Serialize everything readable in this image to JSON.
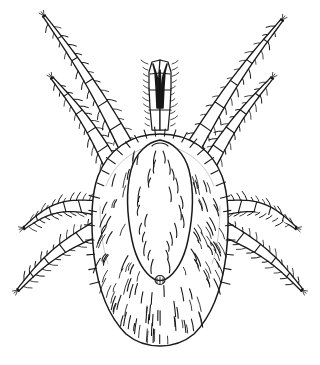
{
  "figure": {
    "kind": "scientific-line-illustration",
    "view": "dorsal",
    "background_color": "#ffffff",
    "ink_color": "#1a1a1a",
    "ghost_color": "#c9c9c9",
    "width": 320,
    "height": 365,
    "caption": "",
    "title": "",
    "label_text": "",
    "has_text": "false"
  },
  "anatomy": {
    "idiosoma": {
      "name": "idiosoma",
      "shape": "oval",
      "center_x": 160,
      "center_y": 240,
      "radius_x": 68,
      "radius_y": 106,
      "top_y": 134,
      "bottom_y": 346,
      "left_x": 92,
      "right_x": 228
    },
    "dorsal_shield": {
      "name": "dorsal-shield",
      "top_y": 140,
      "tip_y": 278,
      "max_half_width": 32,
      "widest_y": 190
    },
    "posterior_organ": {
      "name": "posterior-organ",
      "cx": 160,
      "cy": 280,
      "r": 5
    },
    "gnathosoma": {
      "name": "gnathosoma",
      "base_y": 132,
      "apex_y": 62
    },
    "chelicerae": {
      "count": 2,
      "tip_y": 64,
      "base_y": 108,
      "color": "#111111"
    },
    "palps": {
      "count": 2,
      "segments": 4
    },
    "setae": {
      "body_count": 120,
      "marginal_count": 46,
      "shield_count": 26
    }
  },
  "legs": [
    {
      "id": "leg-1-left",
      "side": "left",
      "pair": 1,
      "direction": "anterior-outward",
      "origin_x": 128,
      "origin_y": 150,
      "tip_x": 44,
      "tip_y": 16,
      "segments": 6,
      "bristles": 26
    },
    {
      "id": "leg-2-left",
      "side": "left",
      "pair": 2,
      "direction": "anterior-outward",
      "origin_x": 113,
      "origin_y": 168,
      "tip_x": 52,
      "tip_y": 78,
      "segments": 5,
      "bristles": 22
    },
    {
      "id": "leg-3-left",
      "side": "left",
      "pair": 3,
      "direction": "lateral",
      "origin_x": 96,
      "origin_y": 208,
      "tip_x": 24,
      "tip_y": 228,
      "segments": 5,
      "bristles": 22
    },
    {
      "id": "leg-4-left",
      "side": "left",
      "pair": 4,
      "direction": "posterior-outward",
      "origin_x": 98,
      "origin_y": 228,
      "tip_x": 18,
      "tip_y": 290,
      "segments": 5,
      "bristles": 22
    },
    {
      "id": "leg-1-right",
      "side": "right",
      "pair": 1,
      "direction": "anterior-outward",
      "origin_x": 192,
      "origin_y": 150,
      "tip_x": 282,
      "tip_y": 20,
      "segments": 6,
      "bristles": 26
    },
    {
      "id": "leg-2-right",
      "side": "right",
      "pair": 2,
      "direction": "anterior-outward",
      "origin_x": 207,
      "origin_y": 168,
      "tip_x": 272,
      "tip_y": 78,
      "segments": 5,
      "bristles": 22
    },
    {
      "id": "leg-3-right",
      "side": "right",
      "pair": 3,
      "direction": "lateral",
      "origin_x": 224,
      "origin_y": 208,
      "tip_x": 296,
      "tip_y": 228,
      "segments": 5,
      "bristles": 22
    },
    {
      "id": "leg-4-right",
      "side": "right",
      "pair": 4,
      "direction": "posterior-outward",
      "origin_x": 222,
      "origin_y": 228,
      "tip_x": 302,
      "tip_y": 290,
      "segments": 5,
      "bristles": 22
    }
  ]
}
